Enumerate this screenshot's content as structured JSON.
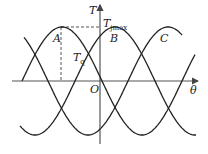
{
  "diagram": {
    "type": "three-phase torque-angle curves",
    "axes": {
      "x_label": "θ",
      "y_label": "T",
      "origin_label": "O"
    },
    "curves": [
      {
        "name": "A",
        "label": "A",
        "phase_deg": 0
      },
      {
        "name": "B",
        "label": "B",
        "phase_deg": -120
      },
      {
        "name": "C",
        "label": "C",
        "phase_deg": -240
      }
    ],
    "annotations": {
      "tjmax_main": "T",
      "tjmax_sub": "jmax",
      "tq_main": "T",
      "tq_sub": "q"
    },
    "colors": {
      "curve": "#222222",
      "axis": "#444444",
      "dashed": "#555555"
    }
  }
}
